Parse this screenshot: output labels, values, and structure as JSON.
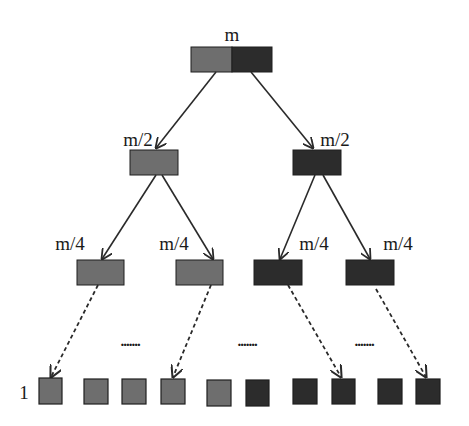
{
  "colors": {
    "light": "#6e6e6e",
    "dark": "#2c2c2c",
    "stroke": "#1e1e1e",
    "edge": "#2a2a2a",
    "text": "#1a1a1a"
  },
  "labels": {
    "root": "m",
    "level2_left": "m/2",
    "level2_right": "m/2",
    "level3_1": "m/4",
    "level3_2": "m/4",
    "level3_3": "m/4",
    "level3_4": "m/4",
    "leaf": "1",
    "dots_1": ".......",
    "dots_2": ".......",
    "dots_3": "......."
  },
  "tree": {
    "root": {
      "label": "m",
      "halves": [
        "light",
        "dark"
      ]
    },
    "level2": [
      {
        "label": "m/2",
        "color": "light"
      },
      {
        "label": "m/2",
        "color": "dark"
      }
    ],
    "level3": [
      {
        "label": "m/4",
        "color": "light"
      },
      {
        "label": "m/4",
        "color": "light"
      },
      {
        "label": "m/4",
        "color": "dark"
      },
      {
        "label": "m/4",
        "color": "dark"
      }
    ],
    "leaves": {
      "label": "1",
      "colors": [
        "light",
        "light",
        "light",
        "light",
        "light",
        "dark",
        "dark",
        "dark",
        "dark",
        "dark"
      ]
    },
    "edges_solid": [
      "root->level2",
      "level2->level3"
    ],
    "edges_dashed": [
      "level3->leaves"
    ]
  }
}
